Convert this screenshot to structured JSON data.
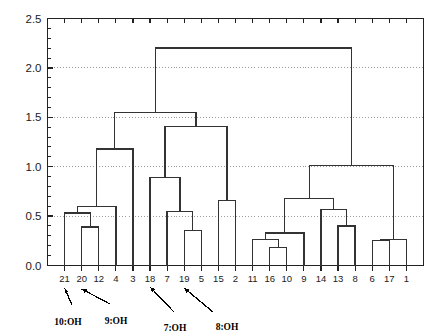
{
  "figure": {
    "title": "",
    "background": "#ffffff",
    "line_color": "#333333",
    "grid_color": "#9a9a9a",
    "axis_color": "#222222"
  },
  "chart_data": {
    "type": "dendrogram",
    "title": "",
    "xlabel": "",
    "ylabel": "",
    "ylim": [
      0.0,
      2.5
    ],
    "grid": true,
    "grid_lines": [
      0.5,
      1.0,
      1.5,
      2.0
    ],
    "legend": "none",
    "yticks": [
      "0.0",
      "0.5",
      "1.0",
      "1.5",
      "2.0",
      "2.5"
    ],
    "ytick_values": [
      0.0,
      0.5,
      1.0,
      1.5,
      2.0,
      2.5
    ],
    "minor_ticks_per_interval": 5,
    "leaf_labels": [
      "21",
      "20",
      "12",
      "4",
      "3",
      "18",
      "7",
      "19",
      "5",
      "15",
      "2",
      "11",
      "16",
      "10",
      "9",
      "14",
      "13",
      "8",
      "6",
      "17",
      "1"
    ],
    "leaf_count": 21,
    "merges": [
      {
        "id": "m1",
        "left": "20",
        "right": "12",
        "height": 0.39
      },
      {
        "id": "m2",
        "left": "21",
        "right": "m1",
        "height": 0.53
      },
      {
        "id": "m3",
        "left": "m2",
        "right": "4",
        "height": 0.6
      },
      {
        "id": "m4",
        "left": "m3",
        "right": "3",
        "height": 1.18
      },
      {
        "id": "m5",
        "left": "19",
        "right": "5",
        "height": 0.355
      },
      {
        "id": "m6",
        "left": "7",
        "right": "m5",
        "height": 0.55
      },
      {
        "id": "m7",
        "left": "18",
        "right": "m6",
        "height": 0.89
      },
      {
        "id": "m8",
        "left": "15",
        "right": "2",
        "height": 0.655
      },
      {
        "id": "m9",
        "left": "m7",
        "right": "m8",
        "height": 1.41
      },
      {
        "id": "m10",
        "left": "m4",
        "right": "m9",
        "height": 1.55
      },
      {
        "id": "m11",
        "left": "16",
        "right": "10",
        "height": 0.185
      },
      {
        "id": "m12",
        "left": "11",
        "right": "m11",
        "height": 0.26
      },
      {
        "id": "m13",
        "left": "m12",
        "right": "9",
        "height": 0.33
      },
      {
        "id": "m14",
        "left": "13",
        "right": "8",
        "height": 0.4
      },
      {
        "id": "m15",
        "left": "14",
        "right": "m14",
        "height": 0.57
      },
      {
        "id": "m16",
        "left": "m13",
        "right": "m15",
        "height": 0.675
      },
      {
        "id": "m17",
        "left": "6",
        "right": "17",
        "height": 0.255
      },
      {
        "id": "m18",
        "left": "m17",
        "right": "1",
        "height": 0.265
      },
      {
        "id": "m19",
        "left": "m16",
        "right": "m18",
        "height": 1.01
      },
      {
        "id": "m20",
        "left": "m10",
        "right": "m19",
        "height": 2.2
      }
    ],
    "annotations": [
      {
        "text": "10:OH",
        "target_leaf": "21"
      },
      {
        "text": "9:OH",
        "target_leaf": "20"
      },
      {
        "text": "7:OH",
        "target_leaf": "18"
      },
      {
        "text": "8:OH",
        "target_leaf": "19"
      }
    ]
  }
}
